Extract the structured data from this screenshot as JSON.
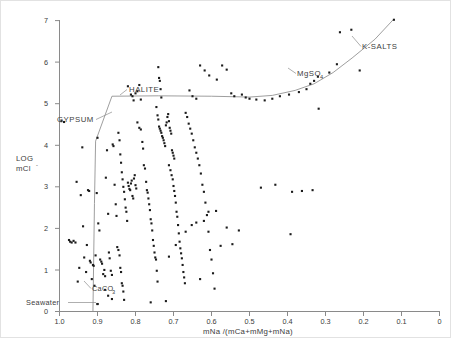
{
  "figure": {
    "title": "",
    "ylabel_line1": "LOG",
    "ylabel_line2": "mCl",
    "ylabel_super": "-",
    "xlabel": "mNa /(mCa+mMg+mNa)"
  },
  "annotations": {
    "gypsum": "GYPSUM",
    "halite": "HALITE",
    "mgso4_base": "MgSO",
    "mgso4_sub": "4",
    "ksalts": "K-SALTS",
    "caco3_base": "CaCO",
    "caco3_sub": "3",
    "seawater": "Seawater"
  },
  "chart_data": {
    "type": "scatter",
    "title": "",
    "xlabel": "mNa /(mCa+mMg+mNa)",
    "ylabel": "LOG mCl-",
    "xlim": [
      1.0,
      0.0
    ],
    "ylim": [
      0,
      7.3
    ],
    "x_reversed": true,
    "grid": false,
    "legend": null,
    "xticks": [
      1.0,
      0.9,
      0.8,
      0.7,
      0.6,
      0.5,
      0.4,
      0.3,
      0.2,
      0.1,
      0.0
    ],
    "xticklabels": [
      "1.0",
      "0.9",
      "0.8",
      "0.7",
      "0.6",
      "0.5",
      "0.4",
      "0.3",
      "0.2",
      "0.1",
      "0"
    ],
    "yticks": [
      0,
      1,
      2,
      3,
      4,
      5,
      6,
      7
    ],
    "yticklabels": [
      "0",
      "1",
      "2",
      "3",
      "4",
      "5",
      "6",
      "7"
    ],
    "marker": "square",
    "marker_size": 2.1,
    "marker_color": "#1b1b1b",
    "series": [
      {
        "name": "water samples",
        "points": [
          [
            0.995,
            4.58
          ],
          [
            0.988,
            4.56
          ],
          [
            0.975,
            1.72
          ],
          [
            0.972,
            1.68
          ],
          [
            0.968,
            1.66
          ],
          [
            0.963,
            1.7
          ],
          [
            0.958,
            1.66
          ],
          [
            0.955,
            3.12
          ],
          [
            0.952,
            0.72
          ],
          [
            0.948,
            1.05
          ],
          [
            0.944,
            2.8
          ],
          [
            0.94,
            3.95
          ],
          [
            0.938,
            2.05
          ],
          [
            0.935,
            1.3
          ],
          [
            0.93,
            0.95
          ],
          [
            0.928,
            1.6
          ],
          [
            0.925,
            2.92
          ],
          [
            0.922,
            2.9
          ],
          [
            0.92,
            1.22
          ],
          [
            0.918,
            1.18
          ],
          [
            0.915,
            0.78
          ],
          [
            0.912,
            1.12
          ],
          [
            0.91,
            1.1
          ],
          [
            0.908,
            0.62
          ],
          [
            0.905,
            1.35
          ],
          [
            0.902,
            2.85
          ],
          [
            0.9,
            4.18
          ],
          [
            0.898,
            2.12
          ],
          [
            0.895,
            1.95
          ],
          [
            0.893,
            1.25
          ],
          [
            0.89,
            1.2
          ],
          [
            0.888,
            1.15
          ],
          [
            0.885,
            0.9
          ],
          [
            0.882,
            1.0
          ],
          [
            0.88,
            0.85
          ],
          [
            0.878,
            3.22
          ],
          [
            0.875,
            3.88
          ],
          [
            0.872,
            2.35
          ],
          [
            0.87,
            1.42
          ],
          [
            0.868,
            1.28
          ],
          [
            0.865,
            0.98
          ],
          [
            0.862,
            0.88
          ],
          [
            0.86,
            4.02
          ],
          [
            0.858,
            3.98
          ],
          [
            0.855,
            3.05
          ],
          [
            0.852,
            2.58
          ],
          [
            0.85,
            2.3
          ],
          [
            0.848,
            1.55
          ],
          [
            0.845,
            1.48
          ],
          [
            0.842,
            1.35
          ],
          [
            0.84,
            1.05
          ],
          [
            0.838,
            0.95
          ],
          [
            0.836,
            0.68
          ],
          [
            0.834,
            0.62
          ],
          [
            0.832,
            0.48
          ],
          [
            0.83,
            0.28
          ],
          [
            0.845,
            4.3
          ],
          [
            0.842,
            4.12
          ],
          [
            0.84,
            3.78
          ],
          [
            0.838,
            3.58
          ],
          [
            0.836,
            3.35
          ],
          [
            0.834,
            3.18
          ],
          [
            0.832,
            3.0
          ],
          [
            0.83,
            2.88
          ],
          [
            0.828,
            2.7
          ],
          [
            0.826,
            2.5
          ],
          [
            0.824,
            2.4
          ],
          [
            0.822,
            2.18
          ],
          [
            0.82,
            3.1
          ],
          [
            0.818,
            3.02
          ],
          [
            0.816,
            2.95
          ],
          [
            0.814,
            2.92
          ],
          [
            0.812,
            3.08
          ],
          [
            0.81,
            3.15
          ],
          [
            0.808,
            2.78
          ],
          [
            0.806,
            2.72
          ],
          [
            0.804,
            3.2
          ],
          [
            0.802,
            3.28
          ],
          [
            0.8,
            3.04
          ],
          [
            0.798,
            2.96
          ],
          [
            0.82,
            5.42
          ],
          [
            0.812,
            5.22
          ],
          [
            0.808,
            5.18
          ],
          [
            0.805,
            5.08
          ],
          [
            0.8,
            5.25
          ],
          [
            0.795,
            5.3
          ],
          [
            0.79,
            5.45
          ],
          [
            0.786,
            5.1
          ],
          [
            0.795,
            4.55
          ],
          [
            0.79,
            4.42
          ],
          [
            0.786,
            4.38
          ],
          [
            0.782,
            4.08
          ],
          [
            0.78,
            3.92
          ],
          [
            0.778,
            3.52
          ],
          [
            0.775,
            3.44
          ],
          [
            0.772,
            3.12
          ],
          [
            0.77,
            2.92
          ],
          [
            0.768,
            2.86
          ],
          [
            0.766,
            2.72
          ],
          [
            0.764,
            2.58
          ],
          [
            0.762,
            2.44
          ],
          [
            0.76,
            2.22
          ],
          [
            0.758,
            2.12
          ],
          [
            0.756,
            1.95
          ],
          [
            0.754,
            1.72
          ],
          [
            0.752,
            1.58
          ],
          [
            0.75,
            1.42
          ],
          [
            0.748,
            1.3
          ],
          [
            0.746,
            1.25
          ],
          [
            0.744,
            0.98
          ],
          [
            0.742,
            0.72
          ],
          [
            0.74,
            5.88
          ],
          [
            0.738,
            5.62
          ],
          [
            0.736,
            5.55
          ],
          [
            0.734,
            5.35
          ],
          [
            0.732,
            5.15
          ],
          [
            0.745,
            4.92
          ],
          [
            0.742,
            4.72
          ],
          [
            0.74,
            4.62
          ],
          [
            0.738,
            4.45
          ],
          [
            0.736,
            4.4
          ],
          [
            0.734,
            4.35
          ],
          [
            0.732,
            4.3
          ],
          [
            0.73,
            4.22
          ],
          [
            0.728,
            4.18
          ],
          [
            0.726,
            4.12
          ],
          [
            0.724,
            4.05
          ],
          [
            0.722,
            3.98
          ],
          [
            0.72,
            4.48
          ],
          [
            0.718,
            4.55
          ],
          [
            0.716,
            4.68
          ],
          [
            0.714,
            4.75
          ],
          [
            0.712,
            4.58
          ],
          [
            0.71,
            4.42
          ],
          [
            0.708,
            4.35
          ],
          [
            0.706,
            4.28
          ],
          [
            0.704,
            3.88
          ],
          [
            0.702,
            3.82
          ],
          [
            0.7,
            3.75
          ],
          [
            0.698,
            3.68
          ],
          [
            0.712,
            3.52
          ],
          [
            0.708,
            3.4
          ],
          [
            0.705,
            3.28
          ],
          [
            0.702,
            3.18
          ],
          [
            0.7,
            3.02
          ],
          [
            0.698,
            2.9
          ],
          [
            0.696,
            2.78
          ],
          [
            0.694,
            2.62
          ],
          [
            0.692,
            2.4
          ],
          [
            0.69,
            2.28
          ],
          [
            0.688,
            2.08
          ],
          [
            0.686,
            1.88
          ],
          [
            0.684,
            1.68
          ],
          [
            0.682,
            1.52
          ],
          [
            0.68,
            1.4
          ],
          [
            0.678,
            1.28
          ],
          [
            0.676,
            1.12
          ],
          [
            0.674,
            0.95
          ],
          [
            0.672,
            0.82
          ],
          [
            0.67,
            0.68
          ],
          [
            0.668,
            4.78
          ],
          [
            0.664,
            4.68
          ],
          [
            0.66,
            4.52
          ],
          [
            0.656,
            4.4
          ],
          [
            0.652,
            4.28
          ],
          [
            0.648,
            4.12
          ],
          [
            0.644,
            3.95
          ],
          [
            0.64,
            3.82
          ],
          [
            0.636,
            3.68
          ],
          [
            0.632,
            3.52
          ],
          [
            0.628,
            3.32
          ],
          [
            0.624,
            3.05
          ],
          [
            0.62,
            2.88
          ],
          [
            0.616,
            2.62
          ],
          [
            0.612,
            2.32
          ],
          [
            0.608,
            1.92
          ],
          [
            0.604,
            1.48
          ],
          [
            0.6,
            1.25
          ],
          [
            0.596,
            0.92
          ],
          [
            0.592,
            0.55
          ],
          [
            0.658,
            5.32
          ],
          [
            0.65,
            5.18
          ],
          [
            0.64,
            5.12
          ],
          [
            0.63,
            5.92
          ],
          [
            0.618,
            5.8
          ],
          [
            0.606,
            5.68
          ],
          [
            0.586,
            5.58
          ],
          [
            0.572,
            5.92
          ],
          [
            0.56,
            5.82
          ],
          [
            0.548,
            5.25
          ],
          [
            0.54,
            5.18
          ],
          [
            0.52,
            5.22
          ],
          [
            0.51,
            5.15
          ],
          [
            0.5,
            5.12
          ],
          [
            0.482,
            5.1
          ],
          [
            0.46,
            5.08
          ],
          [
            0.44,
            5.12
          ],
          [
            0.42,
            5.18
          ],
          [
            0.396,
            5.22
          ],
          [
            0.37,
            5.28
          ],
          [
            0.35,
            5.35
          ],
          [
            0.34,
            5.48
          ],
          [
            0.33,
            5.55
          ],
          [
            0.32,
            5.65
          ],
          [
            0.29,
            5.75
          ],
          [
            0.27,
            5.95
          ],
          [
            0.262,
            6.72
          ],
          [
            0.232,
            6.78
          ],
          [
            0.21,
            5.8
          ],
          [
            0.12,
            7.02
          ],
          [
            0.318,
            4.88
          ],
          [
            0.334,
            2.92
          ],
          [
            0.362,
            2.9
          ],
          [
            0.388,
            2.88
          ],
          [
            0.432,
            3.05
          ],
          [
            0.47,
            2.98
          ],
          [
            0.528,
            1.95
          ],
          [
            0.576,
            1.58
          ],
          [
            0.392,
            1.86
          ],
          [
            0.63,
            0.78
          ],
          [
            0.668,
            1.92
          ],
          [
            0.694,
            1.6
          ],
          [
            0.712,
            1.32
          ],
          [
            0.72,
            0.25
          ],
          [
            0.652,
            2.08
          ],
          [
            0.64,
            2.14
          ],
          [
            0.62,
            2.18
          ],
          [
            0.608,
            2.4
          ],
          [
            0.588,
            2.42
          ],
          [
            0.56,
            2.02
          ],
          [
            0.545,
            1.62
          ],
          [
            0.76,
            0.22
          ],
          [
            0.9,
            0.18
          ],
          [
            0.88,
            0.52
          ],
          [
            0.872,
            0.38
          ],
          [
            0.862,
            0.3
          ]
        ]
      }
    ],
    "mineral_path": {
      "name": "evaporation path",
      "color": "#8c8c8c",
      "vertices": [
        [
          0.912,
          0.0
        ],
        [
          0.908,
          2.6
        ],
        [
          0.905,
          4.1
        ],
        [
          0.862,
          5.18
        ],
        [
          0.74,
          5.19
        ],
        [
          0.6,
          5.18
        ],
        [
          0.5,
          5.16
        ],
        [
          0.44,
          5.2
        ],
        [
          0.38,
          5.32
        ],
        [
          0.33,
          5.48
        ],
        [
          0.28,
          5.75
        ],
        [
          0.23,
          6.1
        ],
        [
          0.17,
          6.55
        ],
        [
          0.122,
          7.02
        ]
      ]
    },
    "labelled_stages": [
      {
        "label": "CaCO3",
        "stage_order": 1
      },
      {
        "label": "GYPSUM",
        "stage_order": 2
      },
      {
        "label": "HALITE",
        "stage_order": 3
      },
      {
        "label": "MgSO4",
        "stage_order": 4
      },
      {
        "label": "K-SALTS",
        "stage_order": 5
      }
    ],
    "highlighted_point": {
      "label": "Seawater",
      "x": 0.9,
      "y": 0.18
    }
  }
}
